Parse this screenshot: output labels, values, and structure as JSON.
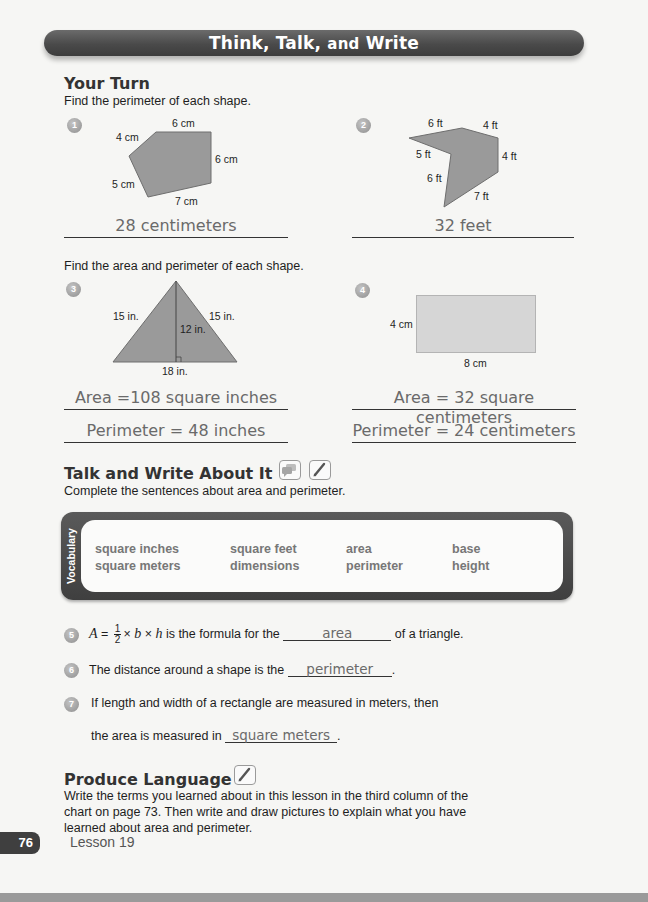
{
  "header": {
    "title_part1": "Think, Talk,",
    "title_part2": "and",
    "title_part3": "Write"
  },
  "your_turn": {
    "heading": "Your Turn",
    "instruction": "Find the perimeter of each shape.",
    "problems": [
      {
        "number": "1",
        "shape": "pentagon",
        "labels": [
          "6 cm",
          "4 cm",
          "6 cm",
          "5 cm",
          "7 cm"
        ],
        "answer": "28 centimeters"
      },
      {
        "number": "2",
        "shape": "irregular hexagon",
        "labels": [
          "6 ft",
          "4 ft",
          "5 ft",
          "4 ft",
          "6 ft",
          "7 ft"
        ],
        "answer": "32 feet"
      }
    ]
  },
  "area_perimeter": {
    "instruction": "Find the area and perimeter of each shape.",
    "problems": [
      {
        "number": "3",
        "shape": "triangle",
        "labels": [
          "15 in.",
          "15 in.",
          "12 in.",
          "18 in."
        ],
        "area_answer": "Area =108 square inches",
        "perimeter_answer": "Perimeter = 48 inches"
      },
      {
        "number": "4",
        "shape": "rectangle",
        "labels": [
          "4 cm",
          "8 cm"
        ],
        "area_answer": "Area = 32 square centimeters",
        "perimeter_answer": "Perimeter = 24 centimeters"
      }
    ]
  },
  "talk_write": {
    "heading": "Talk and Write About It",
    "icons": [
      "speech-bubbles-icon",
      "pencil-icon"
    ],
    "instruction": "Complete the sentences about area and perimeter."
  },
  "vocabulary": {
    "tab_label": "Vocabulary",
    "words": [
      [
        "square inches",
        "square feet",
        "area",
        "base"
      ],
      [
        "square meters",
        "dimensions",
        "perimeter",
        "height"
      ]
    ]
  },
  "sentences": [
    {
      "number": "5",
      "formula_lhs": "A",
      "frac_num": "1",
      "frac_den": "2",
      "formula_b": "b",
      "formula_h": "h",
      "before": " is the formula for the ",
      "answer": "area",
      "after": " of a triangle."
    },
    {
      "number": "6",
      "before": "The distance around a shape is the ",
      "answer": "perimeter",
      "after": "."
    },
    {
      "number": "7",
      "line1": "If length and width of a rectangle are measured in meters, then",
      "before": "the area is measured in ",
      "answer": "square meters",
      "after": "."
    }
  ],
  "produce_language": {
    "heading": "Produce Language",
    "icon": "pencil-icon",
    "text_line1": "Write the terms you learned about in this lesson in the third column of the",
    "text_line2": "chart on page 73. Then write and draw pictures to explain what you have",
    "text_line3": "learned about area and perimeter."
  },
  "footer": {
    "page_number": "76",
    "lesson": "Lesson 19"
  }
}
